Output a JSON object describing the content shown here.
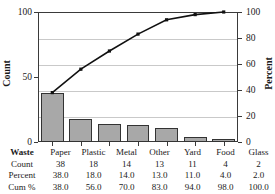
{
  "chart_data": {
    "type": "bar",
    "title": "Pareto Chart of Waste",
    "categories": [
      "Paper",
      "Plastic",
      "Metal",
      "Other",
      "Yard",
      "Food",
      "Glass"
    ],
    "values": [
      38,
      18,
      14,
      13,
      11,
      4,
      2
    ],
    "series": [
      {
        "name": "Count",
        "values": [
          38,
          18,
          14,
          13,
          11,
          4,
          2
        ]
      },
      {
        "name": "Cum %",
        "values": [
          38.0,
          56.0,
          70.0,
          83.0,
          94.0,
          98.0,
          100.0
        ]
      }
    ],
    "percent": [
      38.0,
      18.0,
      14.0,
      13.0,
      11.0,
      4.0,
      2.0
    ],
    "xlabel": "Waste",
    "ylabel": "Count",
    "y2label": "Percent",
    "ylim": [
      0,
      100
    ],
    "y2lim": [
      0,
      100
    ],
    "yticks": [
      0,
      50,
      100
    ],
    "y2ticks": [
      0,
      20,
      40,
      60,
      80,
      100
    ],
    "grid": true,
    "legend": "none",
    "bar_color": "#a8a8a8",
    "bar_edge_color": "#333333",
    "line_color": "#111111",
    "marker": "square"
  },
  "axes": {
    "left_label": "Count",
    "right_label": "Percent",
    "left_ticks": [
      "100",
      "50",
      "0"
    ],
    "right_ticks": [
      "100",
      "80",
      "60",
      "40",
      "20",
      "0"
    ]
  },
  "table": {
    "rows": [
      {
        "label": "Waste",
        "values": [
          "Paper",
          "Plastic",
          "Metal",
          "Other",
          "Yard",
          "Food",
          "Glass"
        ]
      },
      {
        "label": "Count",
        "values": [
          "38",
          "18",
          "14",
          "13",
          "11",
          "4",
          "2"
        ]
      },
      {
        "label": "Percent",
        "values": [
          "38.0",
          "18.0",
          "14.0",
          "13.0",
          "11.0",
          "4.0",
          "2.0"
        ]
      },
      {
        "label": "Cum %",
        "values": [
          "38.0",
          "56.0",
          "70.0",
          "83.0",
          "94.0",
          "98.0",
          "100.0"
        ]
      }
    ]
  }
}
